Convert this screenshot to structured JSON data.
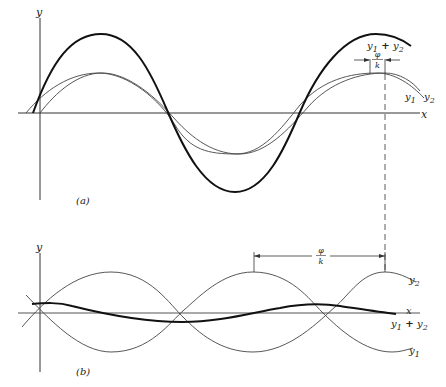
{
  "figure": {
    "panel_a": {
      "label": "(a)",
      "y_axis_label": "y",
      "x_axis_label": "x",
      "curves": [
        {
          "name": "y1",
          "label": "y",
          "sub": "1",
          "style": "thin"
        },
        {
          "name": "y2",
          "label": "y",
          "sub": "2",
          "style": "thin"
        },
        {
          "name": "sum",
          "label_a": "y",
          "sub_a": "1",
          "plus": " + ",
          "label_b": "y",
          "sub_b": "2",
          "style": "thick"
        }
      ],
      "phase_annotation": {
        "num": "φ",
        "den": "k"
      }
    },
    "panel_b": {
      "label": "(b)",
      "y_axis_label": "y",
      "x_axis_label": "x",
      "curves": [
        {
          "name": "y1",
          "label": "y",
          "sub": "1",
          "style": "thin"
        },
        {
          "name": "y2",
          "label": "y",
          "sub": "2",
          "style": "thin"
        },
        {
          "name": "sum",
          "label_a": "y",
          "sub_a": "1",
          "plus": " + ",
          "label_b": "y",
          "sub_b": "2",
          "style": "thick"
        }
      ],
      "phase_annotation": {
        "num": "φ",
        "den": "k"
      }
    }
  }
}
